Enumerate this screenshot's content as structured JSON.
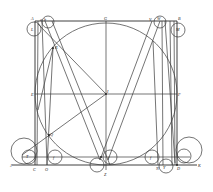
{
  "figure": {
    "type": "geometric-construction",
    "square": {
      "corners": [
        "A",
        "B",
        "D",
        "C"
      ]
    },
    "inscribed_circle": {
      "center": "I",
      "tangent_points": [
        "G",
        "E",
        "F"
      ]
    },
    "base_line": {
      "from": "J",
      "to": "K"
    }
  },
  "labels": {
    "A": "A",
    "B": "B",
    "C": "C",
    "D": "D",
    "E": "E",
    "F": "F",
    "G": "G",
    "I": "I",
    "J": "J",
    "K": "K",
    "L": "L",
    "M": "M",
    "O": "O",
    "Q": "Q",
    "R": "R",
    "V": "V",
    "W": "W",
    "X": "X",
    "Y": "Y",
    "Z": "Z",
    "T": "T",
    "S": "S",
    "N": "N",
    "H": "H",
    "P": "P",
    "f1": "f",
    "f2": "f",
    "f3": "f",
    "a": "a",
    "b": "b",
    "c": "c"
  }
}
